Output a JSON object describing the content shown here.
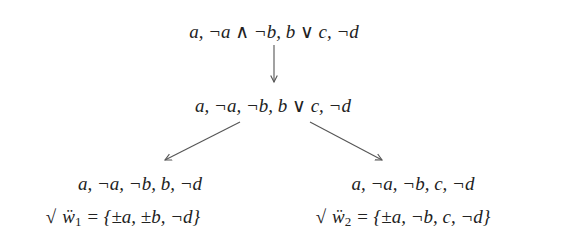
{
  "diagram": {
    "type": "tableau-tree",
    "nodes": {
      "root": {
        "label": "a, ¬a ∧ ¬b, b ∨ c, ¬d"
      },
      "middle": {
        "label": "a, ¬a, ¬b, b ∨ c, ¬d"
      },
      "left_leaf": {
        "label": "a, ¬a, ¬b, b, ¬d",
        "check": "√",
        "world": "ẅ",
        "world_index": "1",
        "set": " = {±a, ±b, ¬d}"
      },
      "right_leaf": {
        "label": "a, ¬a, ¬b, c, ¬d",
        "check": "√",
        "world": "ẅ",
        "world_index": "2",
        "set": " = {±a, ¬b, c, ¬d}"
      }
    },
    "edges": [
      {
        "from": "root",
        "to": "middle"
      },
      {
        "from": "middle",
        "to": "left_leaf"
      },
      {
        "from": "middle",
        "to": "right_leaf"
      }
    ],
    "colors": {
      "text": "#222222",
      "arrow": "#555555",
      "background": "#ffffff"
    }
  }
}
